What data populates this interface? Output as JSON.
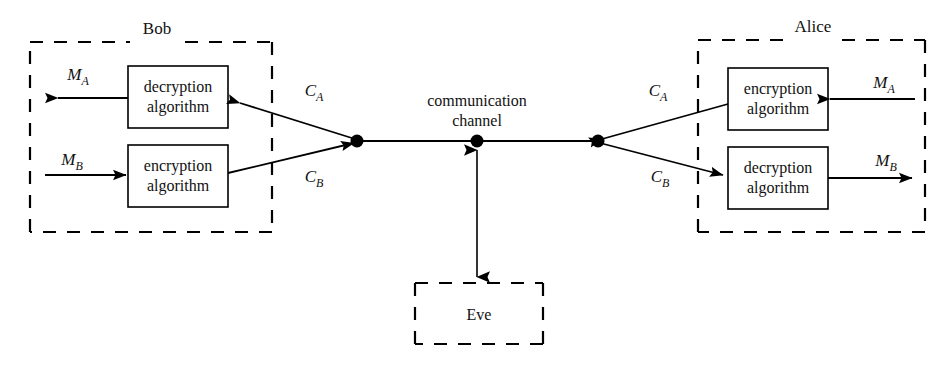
{
  "diagram": {
    "colors": {
      "stroke": "#000000",
      "fill": "#ffffff",
      "text": "#111111"
    },
    "parties": {
      "bob": {
        "label": "Bob",
        "boxes": [
          {
            "line1": "decryption",
            "line2": "algorithm"
          },
          {
            "line1": "encryption",
            "line2": "algorithm"
          }
        ]
      },
      "alice": {
        "label": "Alice",
        "boxes": [
          {
            "line1": "encryption",
            "line2": "algorithm"
          },
          {
            "line1": "decryption",
            "line2": "algorithm"
          }
        ]
      },
      "eve": {
        "label": "Eve"
      }
    },
    "channel": {
      "line1": "communication",
      "line2": "channel"
    },
    "signals": {
      "bob_plain_out": {
        "base": "M",
        "sub": "A"
      },
      "bob_plain_in": {
        "base": "M",
        "sub": "B"
      },
      "bob_cipher_in": {
        "base": "C",
        "sub": "A"
      },
      "bob_cipher_out": {
        "base": "C",
        "sub": "B"
      },
      "alice_cipher_out": {
        "base": "C",
        "sub": "A"
      },
      "alice_cipher_in": {
        "base": "C",
        "sub": "B"
      },
      "alice_plain_in": {
        "base": "M",
        "sub": "A"
      },
      "alice_plain_out": {
        "base": "M",
        "sub": "B"
      }
    }
  }
}
